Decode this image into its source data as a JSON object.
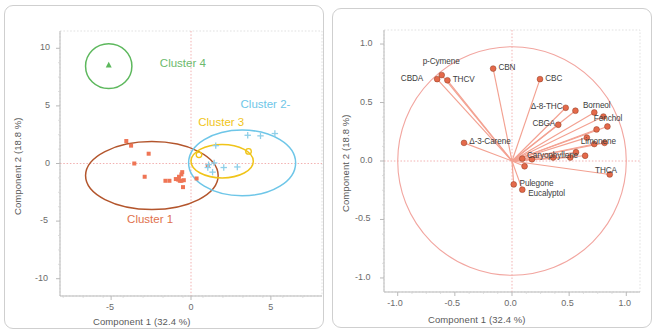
{
  "figure": {
    "panels": [
      {
        "id": "scores",
        "kind": "scores-scatter",
        "xlabel": "Component 1  (32.4 %)",
        "ylabel": "Component 2  (18.8 %)",
        "xticks": [
          "-5",
          "0",
          "5"
        ],
        "yticks": [
          "10",
          "5",
          "0",
          "-5",
          "-10"
        ]
      },
      {
        "id": "loadings",
        "kind": "loadings-biplot",
        "xlabel": "Component 1  (32.4 %)",
        "ylabel": "Component 2  (18.8 %)",
        "xticks": [
          "-1.0",
          "-0.5",
          "0.0",
          "0.5",
          "1.0"
        ],
        "yticks": [
          "1.0",
          "0.5",
          "0.0",
          "-0.5",
          "-1.0"
        ]
      }
    ]
  },
  "clusters": [
    {
      "name": "Cluster 1",
      "color": "#c0572c",
      "label_color": "#e0714c"
    },
    {
      "name": "Cluster 2-",
      "color": "#6ec6e8",
      "label_color": "#6ec6e8"
    },
    {
      "name": "Cluster 3",
      "color": "#f0c419",
      "label_color": "#f0c419"
    },
    {
      "name": "Cluster 4",
      "color": "#5db85d",
      "label_color": "#6cba6c"
    }
  ],
  "colors": {
    "panel_border": "#cfcfcf",
    "gridline": "#d9d9d9",
    "zero_line": "#f0a8a8",
    "axis_text": "#6b6b6b",
    "loading_vector": "#f3a191",
    "loading_marker": "#e4694a",
    "loading_circle": "#f2a6a0",
    "scatter_c1": "#ef7555",
    "scatter_c2": "#8fcfe8",
    "scatter_c3": "#f0c419",
    "scatter_c4": "#5db85d"
  },
  "chart_data": [
    {
      "type": "scatter",
      "id": "pca-scores",
      "title": "",
      "xlabel": "Component 1  (32.4 %)",
      "ylabel": "Component 2  (18.8 %)",
      "xlim": [
        -8.2,
        8.2
      ],
      "ylim": [
        -11.5,
        11.5
      ],
      "grid": true,
      "legend": "inline-cluster-labels",
      "series": [
        {
          "name": "Cluster 1",
          "color": "#ef7555",
          "marker": "square",
          "points": [
            [
              -4.05,
              1.95
            ],
            [
              -3.75,
              1.55
            ],
            [
              -2.65,
              0.85
            ],
            [
              -3.55,
              0.0
            ],
            [
              -2.9,
              -1.15
            ],
            [
              -1.6,
              -1.5
            ],
            [
              -1.35,
              -1.5
            ],
            [
              -0.95,
              -1.35
            ],
            [
              -0.8,
              -1.4
            ],
            [
              -0.7,
              -1.5
            ],
            [
              -0.6,
              -1.5
            ],
            [
              -0.75,
              -1.15
            ],
            [
              -0.6,
              -0.95
            ],
            [
              -0.55,
              -0.75
            ],
            [
              -0.45,
              -1.45
            ],
            [
              -0.5,
              -2.05
            ],
            [
              0.35,
              -1.3
            ],
            [
              1.05,
              -0.2
            ]
          ],
          "ellipse": {
            "cx": -2.45,
            "cy": -1.05,
            "rx": 4.15,
            "ry": 2.95,
            "color": "#b3552c"
          }
        },
        {
          "name": "Cluster 2-",
          "color": "#8fcfe8",
          "marker": "plus",
          "points": [
            [
              1.55,
              1.55
            ],
            [
              3.55,
              2.45
            ],
            [
              4.35,
              2.4
            ],
            [
              5.25,
              2.6
            ],
            [
              1.45,
              0.05
            ],
            [
              2.05,
              -0.35
            ],
            [
              2.9,
              -0.3
            ],
            [
              1.35,
              -0.75
            ],
            [
              1.05,
              -0.35
            ],
            [
              1.1,
              -0.1
            ]
          ],
          "ellipse": {
            "cx": 3.2,
            "cy": 0.05,
            "rx": 3.35,
            "ry": 2.85,
            "color": "#6ec6e8"
          }
        },
        {
          "name": "Cluster 3",
          "color": "#f0c419",
          "marker": "circle",
          "points": [
            [
              0.5,
              0.75
            ],
            [
              3.6,
              1.05
            ]
          ],
          "ellipse": {
            "cx": 1.95,
            "cy": 0.2,
            "rx": 1.95,
            "ry": 1.45,
            "color": "#f0c419"
          }
        },
        {
          "name": "Cluster 4",
          "color": "#5db85d",
          "marker": "triangle",
          "points": [
            [
              -5.15,
              8.55
            ]
          ],
          "ellipse": {
            "cx": -5.15,
            "cy": 8.45,
            "rx": 1.45,
            "ry": 1.95,
            "color": "#5db85d"
          }
        }
      ]
    },
    {
      "type": "scatter",
      "id": "pca-loadings",
      "title": "",
      "xlabel": "Component 1  (32.4 %)",
      "ylabel": "Component 2  (18.8 %)",
      "xlim": [
        -1.12,
        1.12
      ],
      "ylim": [
        -1.12,
        1.12
      ],
      "grid": true,
      "unit_circle": true,
      "loadings": [
        {
          "label": "p-Cymene",
          "x": -0.615,
          "y": 0.735,
          "lx": -0.62,
          "ly": 0.845,
          "anchor": "middle"
        },
        {
          "label": "CBDA",
          "x": -0.655,
          "y": 0.7,
          "lx": -0.78,
          "ly": 0.7,
          "anchor": "end"
        },
        {
          "label": "THCV",
          "x": -0.565,
          "y": 0.69,
          "lx": -0.545,
          "ly": 0.69,
          "anchor": "start"
        },
        {
          "label": "CBN",
          "x": -0.165,
          "y": 0.79,
          "lx": -0.145,
          "ly": 0.79,
          "anchor": "start"
        },
        {
          "label": "CBC",
          "x": 0.245,
          "y": 0.7,
          "lx": 0.265,
          "ly": 0.7,
          "anchor": "start"
        },
        {
          "label": "Δ-8-THC",
          "x": 0.47,
          "y": 0.455,
          "lx": 0.445,
          "ly": 0.455,
          "anchor": "end"
        },
        {
          "label": "Borneol",
          "x": 0.555,
          "y": 0.43,
          "lx": 0.595,
          "ly": 0.47,
          "anchor": "start"
        },
        {
          "label": "CBGA",
          "x": 0.405,
          "y": 0.31,
          "lx": 0.38,
          "ly": 0.31,
          "anchor": "end"
        },
        {
          "label": "Fenchol",
          "x": 0.72,
          "y": 0.415,
          "lx": 0.69,
          "ly": 0.355,
          "anchor": "start"
        },
        {
          "label": "Δ-3-Carene",
          "x": -0.42,
          "y": 0.155,
          "lx": -0.4,
          "ly": 0.155,
          "anchor": "start"
        },
        {
          "label": "Limonene",
          "x": 0.74,
          "y": 0.27,
          "lx": 0.575,
          "ly": 0.16,
          "anchor": "start"
        },
        {
          "label": "Caryophyllene",
          "x": 0.56,
          "y": 0.075,
          "lx": 0.105,
          "ly": 0.04,
          "anchor": "start"
        },
        {
          "label": "THCA",
          "x": 0.855,
          "y": -0.115,
          "lx": 0.7,
          "ly": -0.09,
          "anchor": "start"
        },
        {
          "label": "Pulegone",
          "x": 0.015,
          "y": -0.2,
          "lx": 0.04,
          "ly": -0.205,
          "anchor": "start"
        },
        {
          "label": "Eucalyptol",
          "x": 0.09,
          "y": -0.245,
          "lx": 0.115,
          "ly": -0.285,
          "anchor": "start"
        },
        {
          "label": "",
          "x": 0.8,
          "y": 0.38,
          "lx": 0.8,
          "ly": 0.38,
          "anchor": "start"
        },
        {
          "label": "",
          "x": 0.835,
          "y": 0.295,
          "lx": 0.835,
          "ly": 0.295,
          "anchor": "start"
        },
        {
          "label": "",
          "x": 0.81,
          "y": 0.155,
          "lx": 0.81,
          "ly": 0.155,
          "anchor": "start"
        },
        {
          "label": "",
          "x": 0.72,
          "y": 0.145,
          "lx": 0.72,
          "ly": 0.145,
          "anchor": "start"
        },
        {
          "label": "",
          "x": 0.655,
          "y": 0.2,
          "lx": 0.655,
          "ly": 0.2,
          "anchor": "start"
        },
        {
          "label": "",
          "x": 0.64,
          "y": 0.045,
          "lx": 0.64,
          "ly": 0.045,
          "anchor": "start"
        },
        {
          "label": "",
          "x": 0.51,
          "y": 0.03,
          "lx": 0.51,
          "ly": 0.03,
          "anchor": "start"
        },
        {
          "label": "",
          "x": 0.36,
          "y": 0.03,
          "lx": 0.36,
          "ly": 0.03,
          "anchor": "start"
        },
        {
          "label": "",
          "x": 0.175,
          "y": 0.015,
          "lx": 0.175,
          "ly": 0.015,
          "anchor": "start"
        },
        {
          "label": "",
          "x": 0.11,
          "y": -0.045,
          "lx": 0.11,
          "ly": -0.045,
          "anchor": "start"
        },
        {
          "label": "",
          "x": 0.09,
          "y": 0.02,
          "lx": 0.09,
          "ly": 0.02,
          "anchor": "start"
        }
      ]
    }
  ]
}
